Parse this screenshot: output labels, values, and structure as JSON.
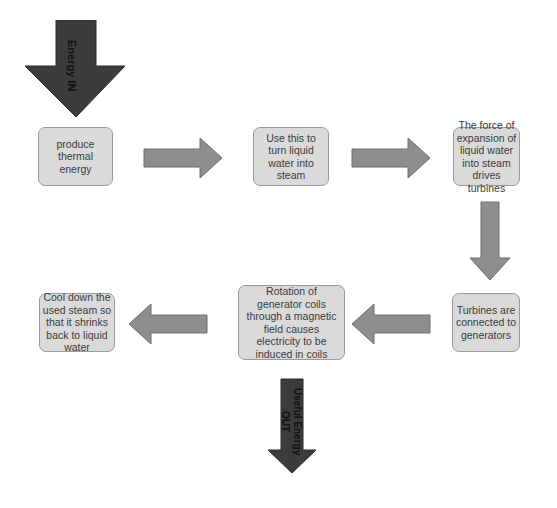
{
  "diagram": {
    "type": "flowchart",
    "colors": {
      "box_fill": "#dadada",
      "box_border": "#9a9a9a",
      "flow_arrow": "#8e8e8e",
      "io_arrow": "#3c3c3c"
    },
    "energy_in": {
      "label": "Energy IN"
    },
    "useful_out": {
      "label_line1": "Useful Energy",
      "label_line2": "OUT"
    },
    "steps": [
      {
        "id": 1,
        "text": "produce thermal energy"
      },
      {
        "id": 2,
        "text": "Use this to turn liquid water into steam"
      },
      {
        "id": 3,
        "text": "The force of expansion of liquid water into steam drives turbines"
      },
      {
        "id": 4,
        "text": "Turbines are connected to generators"
      },
      {
        "id": 5,
        "text": "Rotation of generator coils through a magnetic field causes electricity to be induced in coils"
      },
      {
        "id": 6,
        "text": "Cool down the used steam so that it shrinks back to liquid water"
      }
    ],
    "connections": [
      {
        "from": 1,
        "to": 2,
        "direction": "right"
      },
      {
        "from": 2,
        "to": 3,
        "direction": "right"
      },
      {
        "from": 3,
        "to": 4,
        "direction": "down"
      },
      {
        "from": 4,
        "to": 5,
        "direction": "left"
      },
      {
        "from": 5,
        "to": 6,
        "direction": "left"
      }
    ]
  }
}
